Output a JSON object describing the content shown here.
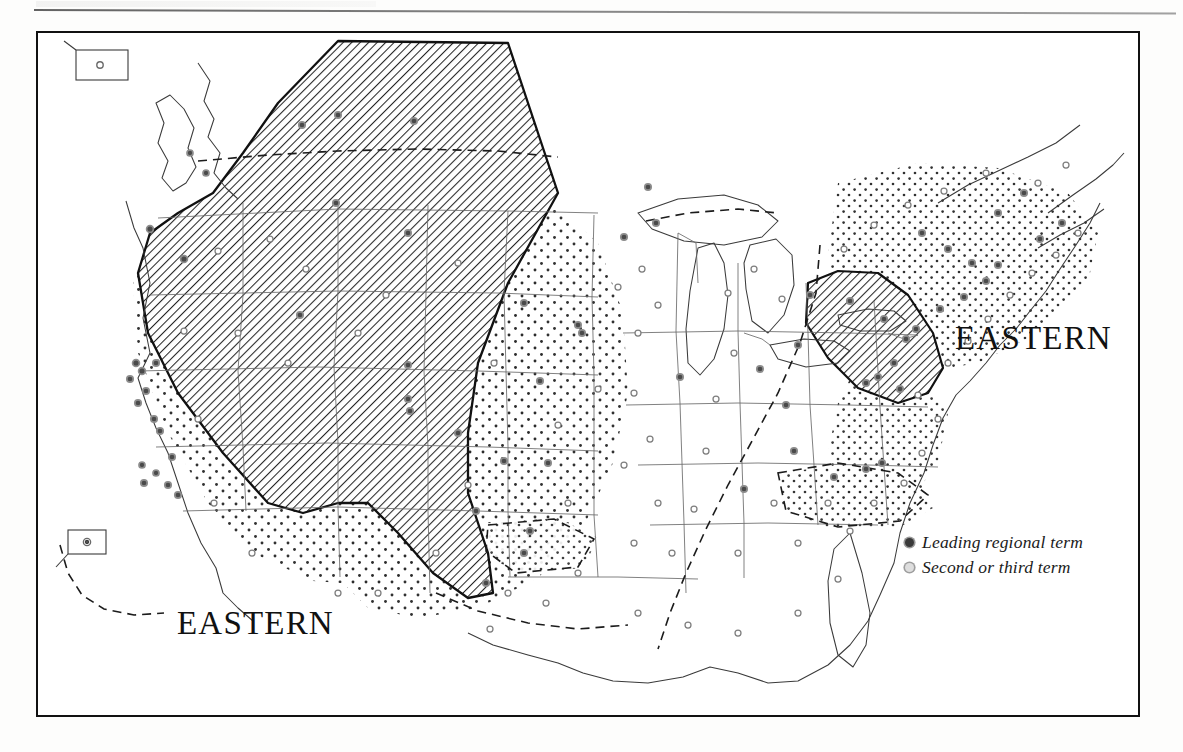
{
  "page": {
    "has_top_rule": true,
    "background_color": "#fdfdfc"
  },
  "plate": {
    "frame_color": "#111111",
    "fill_color": "#ffffff"
  },
  "labels": [
    {
      "name": "eastern-northeast",
      "text": "EASTERN",
      "x": 917,
      "y": 287
    },
    {
      "name": "eastern-southwest",
      "text": "EASTERN",
      "x": 139,
      "y": 572
    }
  ],
  "legend": {
    "items": [
      {
        "symbol": "filled-dot-icon",
        "label": "Leading regional term",
        "color": "#3a3a3a"
      },
      {
        "symbol": "hollow-dot-icon",
        "label": "Second or third term",
        "color": "#dedede"
      }
    ]
  },
  "map": {
    "title_label_text": "EASTERN",
    "insets": [
      {
        "name": "alaska-inset",
        "x": 72,
        "y": 45,
        "w": 52,
        "h": 30
      },
      {
        "name": "hawaii-inset",
        "x": 62,
        "y": 528,
        "w": 38,
        "h": 24
      }
    ],
    "patterns": {
      "hatch": {
        "name": "diagonal-hatch",
        "angle_deg": 45,
        "spacing_px": 4.2,
        "color": "#2a2a2a"
      },
      "stipple": {
        "name": "stipple-dots",
        "spacing_px": 13,
        "dot_radius_px": 1.5,
        "color": "#2a2a2a"
      }
    },
    "hatched_regions": [
      {
        "name": "western-hatch-region",
        "description": "Western interior: Pacific Northwest interior through Rockies, Great Plains to west Texas"
      },
      {
        "name": "northeast-hatch-region",
        "description": "Pennsylvania, New Jersey, southern New York"
      }
    ],
    "stippled_regions": [
      {
        "name": "pacific-stipple",
        "description": "Pacific coast, Washington, Oregon, California, Nevada"
      },
      {
        "name": "plains-stipple",
        "description": "Great Plains, Texas, Oklahoma, Kansas"
      },
      {
        "name": "northeast-stipple",
        "description": "New England, New York, Mid-Atlantic"
      },
      {
        "name": "southeast-stipple",
        "description": "Carolinas, Georgia, Alabama pockets"
      }
    ],
    "isogloss_lines": [
      {
        "name": "mississippi-dashed-isogloss",
        "style": "dashed"
      },
      {
        "name": "canada-border-dashed",
        "style": "dashed"
      },
      {
        "name": "gulf-coast-dashed",
        "style": "dashed"
      }
    ]
  }
}
